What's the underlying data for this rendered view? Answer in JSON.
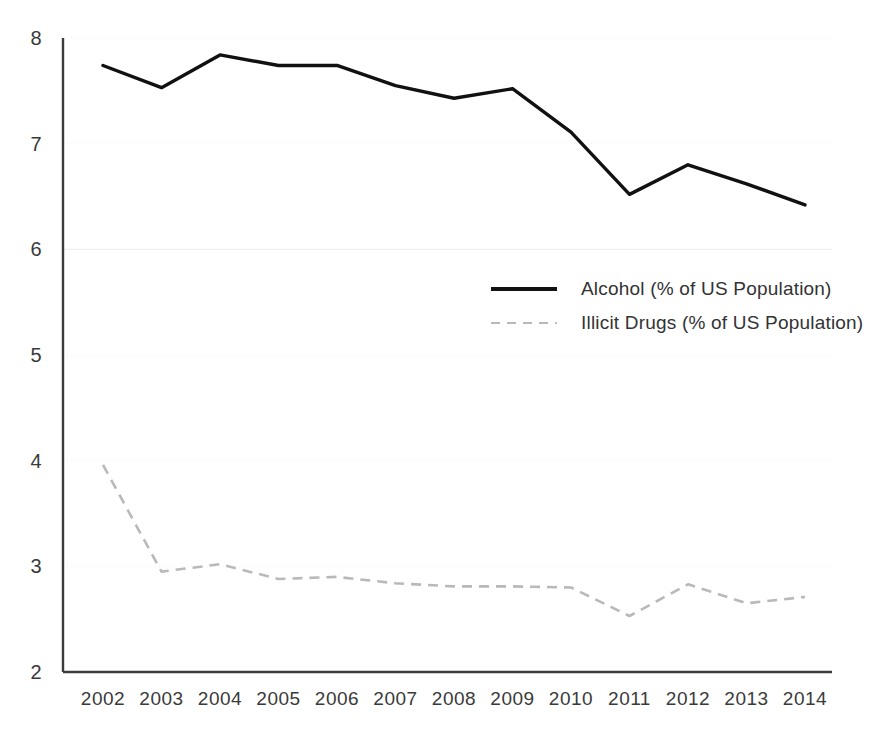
{
  "chart_data": {
    "type": "line",
    "title": "",
    "xlabel": "",
    "ylabel": "",
    "x": [
      2002,
      2003,
      2004,
      2005,
      2006,
      2007,
      2008,
      2009,
      2010,
      2011,
      2012,
      2013,
      2014
    ],
    "categories": [
      "2002",
      "2003",
      "2004",
      "2005",
      "2006",
      "2007",
      "2008",
      "2009",
      "2010",
      "2011",
      "2012",
      "2013",
      "2014"
    ],
    "series": [
      {
        "name": "Alcohol (% of US Population)",
        "style": "solid",
        "color": "#111111",
        "values": [
          7.74,
          7.53,
          7.84,
          7.74,
          7.74,
          7.55,
          7.43,
          7.52,
          7.11,
          6.52,
          6.8,
          6.62,
          6.42
        ]
      },
      {
        "name": "Illicit Drugs (% of US Population)",
        "style": "dashed",
        "color": "#b9b9b9",
        "values": [
          3.96,
          2.95,
          3.02,
          2.88,
          2.9,
          2.84,
          2.81,
          2.81,
          2.8,
          2.53,
          2.83,
          2.65,
          2.71
        ]
      }
    ],
    "ylim": [
      2,
      8
    ],
    "yticks": [
      "2",
      "3",
      "4",
      "5",
      "6",
      "7",
      "8"
    ],
    "xlim": [
      2002,
      2014
    ],
    "grid": true,
    "grid_axis": "y",
    "legend_position": "center-right"
  },
  "legend": {
    "entries": [
      {
        "label": "Alcohol (% of US Population)",
        "sample": "solid-line-sample"
      },
      {
        "label": "Illicit Drugs (% of US Population)",
        "sample": "dashed-line-sample"
      }
    ]
  }
}
